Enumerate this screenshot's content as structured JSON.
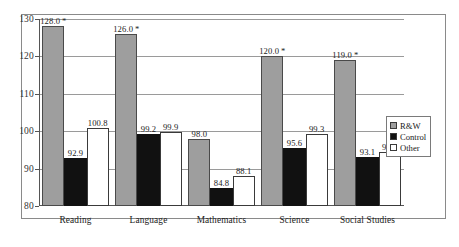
{
  "chart_data": {
    "type": "bar",
    "title": "",
    "xlabel": "",
    "ylabel": "",
    "ylim": [
      80,
      130
    ],
    "yticks": [
      80,
      90,
      100,
      110,
      120,
      130
    ],
    "grid": true,
    "legend_position": "right",
    "categories": [
      "Reading",
      "Language",
      "Mathematics",
      "Science",
      "Social Studies"
    ],
    "series": [
      {
        "name": "R&W",
        "color": "#9e9e9e",
        "values": [
          128.0,
          126.0,
          98.0,
          120.0,
          119.0
        ]
      },
      {
        "name": "Control",
        "color": "#111111",
        "values": [
          92.9,
          99.2,
          84.8,
          95.6,
          93.1
        ]
      },
      {
        "name": "Other",
        "color": "#ffffff",
        "values": [
          100.8,
          99.9,
          88.1,
          99.3,
          94.4
        ]
      }
    ],
    "data_labels": [
      [
        "128.0",
        "92.9",
        "100.8"
      ],
      [
        "126.0",
        "99.2",
        "99.9"
      ],
      [
        "98.0",
        "84.8",
        "88.1"
      ],
      [
        "120.0",
        "95.6",
        "99.3"
      ],
      [
        "119.0",
        "93.1",
        "94.4"
      ]
    ],
    "significance_marks": [
      [
        "*",
        "",
        ""
      ],
      [
        "*",
        "",
        ""
      ],
      [
        "",
        "",
        ""
      ],
      [
        "*",
        "",
        ""
      ],
      [
        "*",
        "",
        ""
      ]
    ]
  },
  "legend": {
    "items": [
      {
        "label": "R&W",
        "swatch": "rw"
      },
      {
        "label": "Control",
        "swatch": "control"
      },
      {
        "label": "Other",
        "swatch": "other"
      }
    ]
  }
}
